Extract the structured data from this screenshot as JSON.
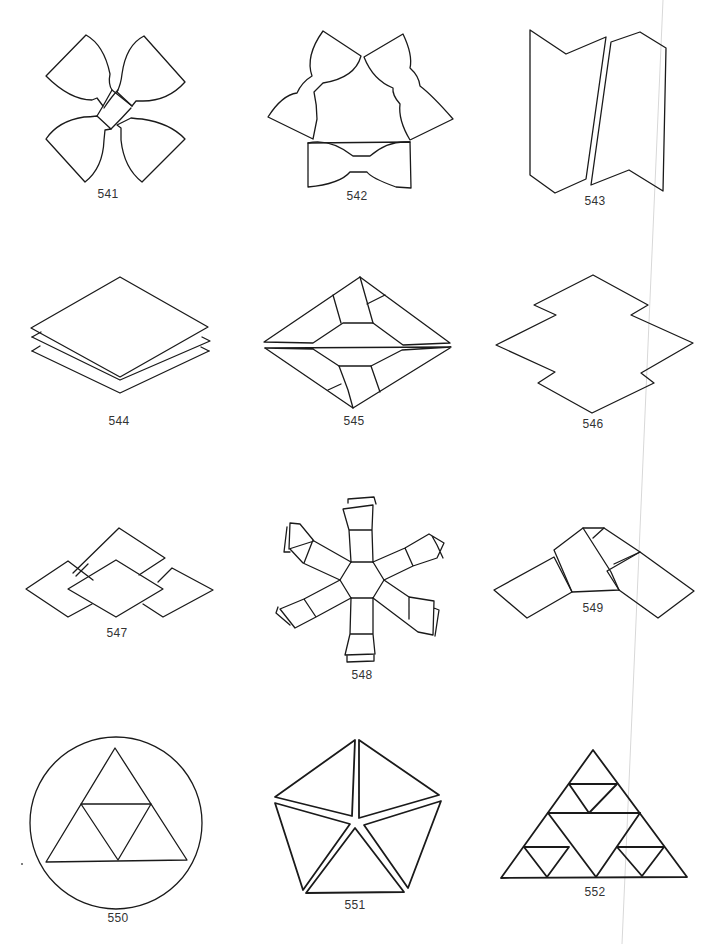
{
  "page": {
    "background": "#ffffff",
    "ink_color": "#1a1a1a",
    "layout": "4 rows x 3 columns of line-drawing figures, each with a numeric caption"
  },
  "figures": [
    {
      "number": "541",
      "description": "four curved bow-tie petals crossing diagonally in an X"
    },
    {
      "number": "542",
      "description": "three bow-tie shapes arranged in a triangle"
    },
    {
      "number": "543",
      "description": "two tall chevron-ended strips side by side"
    },
    {
      "number": "544",
      "description": "three stacked diamond sheets"
    },
    {
      "number": "545",
      "description": "flattened diamond with inner hexagon and folded flaps"
    },
    {
      "number": "546",
      "description": "diamond outline with stepped notches"
    },
    {
      "number": "547",
      "description": "four diamonds interlocked around a central diamond"
    },
    {
      "number": "548",
      "description": "six-armed star of strips around a central hexagon"
    },
    {
      "number": "549",
      "description": "two strips folded into a wide V"
    },
    {
      "number": "550",
      "description": "triangle subdivided into four triangles inside a circle"
    },
    {
      "number": "551",
      "description": "pentagon split into five triangles"
    },
    {
      "number": "552",
      "description": "two-level Sierpinski-style subdivided triangle"
    }
  ]
}
